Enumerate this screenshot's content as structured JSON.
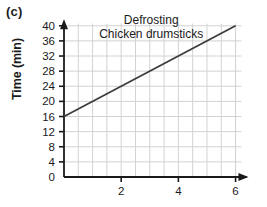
{
  "panel": {
    "label": "(c)"
  },
  "chart_data": {
    "type": "line",
    "title_lines": [
      "Defrosting",
      "Chicken drumsticks"
    ],
    "xlabel": "",
    "ylabel": "Time (min)",
    "xlim": [
      0,
      6.4
    ],
    "ylim": [
      0,
      41
    ],
    "grid": true,
    "legend": "none",
    "x_major_ticks": [
      2,
      4,
      6
    ],
    "x_major_tick_labels": [
      "2",
      "4",
      "6"
    ],
    "x_minor_gridlines": [
      0.5,
      1,
      1.5,
      2,
      2.5,
      3,
      3.5,
      4,
      4.5,
      5,
      5.5,
      6
    ],
    "y_major_ticks": [
      0,
      4,
      8,
      12,
      16,
      20,
      24,
      28,
      32,
      36,
      40
    ],
    "y_major_tick_labels": [
      "0",
      "4",
      "8",
      "12",
      "16",
      "20",
      "24",
      "28",
      "32",
      "36",
      "40"
    ],
    "series": [
      {
        "name": "Defrosting time",
        "x": [
          0,
          6
        ],
        "values": [
          16,
          40
        ],
        "intercept": 16,
        "slope": 4,
        "color": "#3c3c3c"
      }
    ],
    "colors": {
      "axis": "#1a1a1a",
      "gridline": "#d2d2d2",
      "line": "#3c3c3c",
      "text": "#1a1a1a",
      "background": "#ffffff"
    }
  }
}
